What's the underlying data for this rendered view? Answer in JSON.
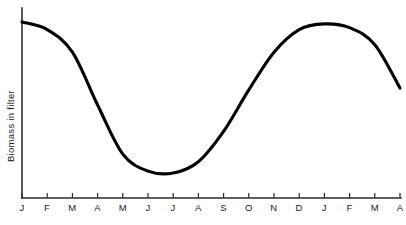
{
  "chart_data": {
    "type": "line",
    "title": "",
    "subtitle": "",
    "xlabel": "",
    "ylabel": "Biomass in filter",
    "grid": false,
    "legend": null,
    "x_tick_labels": [
      "J",
      "F",
      "M",
      "A",
      "M",
      "J",
      "J",
      "A",
      "S",
      "O",
      "N",
      "D",
      "J",
      "F",
      "M",
      "A"
    ],
    "x_tick_names": [
      "January",
      "February",
      "March",
      "April",
      "May",
      "June",
      "July",
      "August",
      "September",
      "October",
      "November",
      "December",
      "January",
      "February",
      "March",
      "April"
    ],
    "y_tick_labels": [],
    "ylim": [
      0,
      100
    ],
    "xlim": [
      0,
      15
    ],
    "y_axis_quantitative": false,
    "series": [
      {
        "name": "Biomass in filter",
        "color": "#000000",
        "x": [
          0,
          1,
          2,
          3,
          4,
          5,
          6,
          7,
          8,
          9,
          10,
          11,
          12,
          13,
          14,
          15
        ],
        "values": [
          92,
          88,
          76,
          48,
          22,
          13,
          12,
          18,
          34,
          56,
          76,
          88,
          91,
          89,
          80,
          57
        ]
      }
    ],
    "annotations": [
      "Curve starts high in January",
      "Steep decline through March and April",
      "Minimum plateau across June and July",
      "Recovery through September to November",
      "Second peak around December and January",
      "Decline resumes toward April"
    ]
  },
  "axes": {
    "y_title": "Biomass in filter",
    "x_title": ""
  },
  "colors": {
    "curve": "#000000",
    "axis": "#2b2b2b",
    "background": "#ffffff",
    "text": "#1a1a1a"
  }
}
